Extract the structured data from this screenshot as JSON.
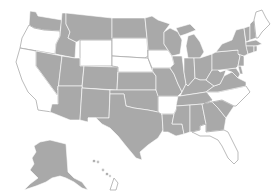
{
  "map": {
    "title": "",
    "fill_colors": {
      "highlighted": "#a9a9a9",
      "not_highlighted": "#ffffff",
      "border": "#ffffff"
    },
    "highlighted_states": [
      "WA",
      "ID",
      "MT",
      "NV",
      "UT",
      "CO",
      "AZ",
      "NM",
      "ND",
      "MN",
      "KS",
      "OK",
      "TX",
      "MO",
      "LA",
      "WI",
      "IL",
      "MI",
      "IN",
      "OH",
      "KY",
      "TN",
      "MS",
      "AL",
      "GA",
      "SC",
      "VA",
      "WV",
      "PA",
      "NY",
      "VT",
      "NH",
      "MA",
      "CT",
      "RI",
      "NJ",
      "DE",
      "MD",
      "AK",
      "HI"
    ],
    "not_highlighted_states": [
      "OR",
      "CA",
      "WY",
      "SD",
      "NE",
      "IA",
      "AR",
      "NC",
      "FL",
      "ME"
    ]
  }
}
